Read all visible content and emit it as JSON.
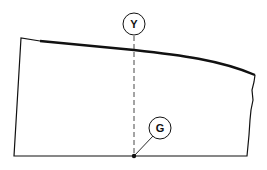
{
  "diagram": {
    "type": "technical-outline",
    "callouts": [
      {
        "id": "Y",
        "label": "Y",
        "meaning": "vertical reference line"
      },
      {
        "id": "G",
        "label": "G",
        "meaning": "point on base line"
      }
    ],
    "colors": {
      "line": "#111111",
      "background": "#ffffff"
    }
  }
}
